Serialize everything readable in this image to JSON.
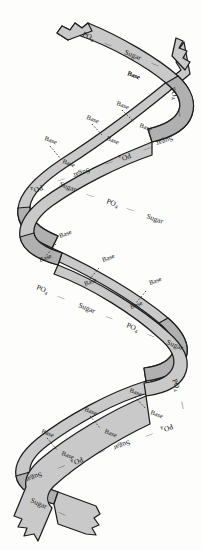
{
  "figure": {
    "name": "dna-double-helix",
    "background_color": "#fdfdfc",
    "ribbon_front_color": "#c9c9c9",
    "ribbon_back_color": "#b0b0b0",
    "outline_color": "#1c1c1c",
    "text_color": "#1a1a1a"
  },
  "labels": {
    "base": "Base",
    "sugar": "Sugar",
    "phosphate": "PO",
    "phosphate_sub": "4",
    "dash": "—"
  },
  "backbone_runs": [
    {
      "id": "run-top-right-strand",
      "text_sequence": [
        "PO4",
        "Sugar"
      ],
      "glyphs": [
        {
          "text": "PO",
          "sub": "4",
          "x": 82,
          "y": 36,
          "rot": 22
        },
        {
          "text": "—",
          "x": 104,
          "y": 45,
          "rot": 22
        },
        {
          "text": "Sugar",
          "x": 124,
          "y": 54,
          "rot": 22
        },
        {
          "text": "—",
          "x": 151,
          "y": 65,
          "rot": 22
        }
      ]
    },
    {
      "id": "run-upper-right-descend",
      "glyphs": [
        {
          "text": "PO",
          "sub": "4",
          "x": 170,
          "y": 88,
          "rot": 72
        },
        {
          "text": "—",
          "x": 177,
          "y": 110,
          "rot": 80
        },
        {
          "text": "Sugar",
          "x": 172,
          "y": 136,
          "rot": 160
        },
        {
          "text": "—",
          "x": 150,
          "y": 146,
          "rot": 160
        },
        {
          "text": "PO",
          "sub": "4",
          "x": 130,
          "y": 153,
          "rot": 160
        },
        {
          "text": "—",
          "x": 112,
          "y": 160,
          "rot": 160
        },
        {
          "text": "Sugar",
          "x": 89,
          "y": 168,
          "rot": 160
        },
        {
          "text": "—",
          "x": 64,
          "y": 177,
          "rot": 160
        },
        {
          "text": "PO",
          "sub": "4",
          "x": 42,
          "y": 185,
          "rot": 160
        }
      ]
    },
    {
      "id": "run-mid-left-descend",
      "glyphs": [
        {
          "text": "PO",
          "sub": "4",
          "x": 36,
          "y": 289,
          "rot": 22
        },
        {
          "text": "—",
          "x": 57,
          "y": 298,
          "rot": 22
        },
        {
          "text": "Sugar",
          "x": 78,
          "y": 307,
          "rot": 22
        },
        {
          "text": "—",
          "x": 105,
          "y": 318,
          "rot": 22
        },
        {
          "text": "PO",
          "sub": "4",
          "x": 126,
          "y": 327,
          "rot": 22
        },
        {
          "text": "—",
          "x": 147,
          "y": 336,
          "rot": 22
        },
        {
          "text": "Sugar",
          "x": 166,
          "y": 344,
          "rot": 22
        }
      ]
    },
    {
      "id": "run-lower-right-descend",
      "glyphs": [
        {
          "text": "PO",
          "sub": "4",
          "x": 172,
          "y": 380,
          "rot": 70
        },
        {
          "text": "—",
          "x": 180,
          "y": 402,
          "rot": 78
        },
        {
          "text": "PO",
          "sub": "4",
          "x": 172,
          "y": 424,
          "rot": 158
        },
        {
          "text": "—",
          "x": 152,
          "y": 432,
          "rot": 158
        },
        {
          "text": "Sugar",
          "x": 129,
          "y": 440,
          "rot": 158
        },
        {
          "text": "—",
          "x": 104,
          "y": 449,
          "rot": 158
        },
        {
          "text": "PO",
          "sub": "4",
          "x": 82,
          "y": 457,
          "rot": 158
        },
        {
          "text": "—",
          "x": 64,
          "y": 464,
          "rot": 158
        },
        {
          "text": "Sugar",
          "x": 41,
          "y": 472,
          "rot": 158
        }
      ]
    },
    {
      "id": "run-bottom-left-tail",
      "glyphs": [
        {
          "text": "Sugar",
          "x": 30,
          "y": 502,
          "rot": 24
        },
        {
          "text": "—",
          "x": 58,
          "y": 514,
          "rot": 24
        }
      ]
    },
    {
      "id": "run-mid-upper-inner",
      "glyphs": [
        {
          "text": "Sugar",
          "x": 59,
          "y": 186,
          "rot": 20
        },
        {
          "text": "—",
          "x": 86,
          "y": 196,
          "rot": 20
        },
        {
          "text": "PO",
          "sub": "4",
          "x": 106,
          "y": 203,
          "rot": 20
        },
        {
          "text": "—",
          "x": 126,
          "y": 210,
          "rot": 20
        },
        {
          "text": "Sugar",
          "x": 146,
          "y": 218,
          "rot": 20
        }
      ]
    }
  ],
  "base_pairs": [
    {
      "id": "bp-1",
      "left": {
        "x": 116,
        "y": 105,
        "rot": 20
      },
      "right": {
        "x": 139,
        "y": 127,
        "rot": 20
      }
    },
    {
      "id": "bp-2",
      "left": {
        "x": 86,
        "y": 119,
        "rot": 20
      },
      "right": {
        "x": 106,
        "y": 140,
        "rot": 20
      }
    },
    {
      "id": "bp-3",
      "left": {
        "x": 44,
        "y": 140,
        "rot": 20
      },
      "right": {
        "x": 62,
        "y": 163,
        "rot": 20
      }
    },
    {
      "id": "bp-4",
      "left": {
        "x": 60,
        "y": 238,
        "rot": -20
      },
      "right": {
        "x": 40,
        "y": 262,
        "rot": -20
      }
    },
    {
      "id": "bp-5",
      "left": {
        "x": 103,
        "y": 262,
        "rot": -20
      },
      "right": {
        "x": 85,
        "y": 286,
        "rot": -20
      }
    },
    {
      "id": "bp-6",
      "left": {
        "x": 150,
        "y": 285,
        "rot": -20
      },
      "right": {
        "x": 131,
        "y": 309,
        "rot": -20
      }
    },
    {
      "id": "bp-7",
      "left": {
        "x": 129,
        "y": 392,
        "rot": 20
      },
      "right": {
        "x": 150,
        "y": 414,
        "rot": 20
      }
    },
    {
      "id": "bp-8",
      "left": {
        "x": 84,
        "y": 411,
        "rot": 20
      },
      "right": {
        "x": 104,
        "y": 433,
        "rot": 20
      }
    },
    {
      "id": "bp-9",
      "left": {
        "x": 41,
        "y": 433,
        "rot": 20
      },
      "right": {
        "x": 61,
        "y": 455,
        "rot": 20
      }
    },
    {
      "id": "bp-10",
      "left": {
        "x": 127,
        "y": 75,
        "rot": 20
      },
      "right": {
        "x": 127,
        "y": 75,
        "rot": 20
      }
    }
  ],
  "strand_ends": [
    {
      "id": "end-top-left",
      "type": "torn-edge",
      "x": 58,
      "y": 28
    },
    {
      "id": "end-top-right",
      "type": "torn-edge",
      "x": 176,
      "y": 44
    },
    {
      "id": "end-bottom-left",
      "type": "torn-edge",
      "x": 26,
      "y": 520
    },
    {
      "id": "end-bottom-right",
      "type": "torn-edge",
      "x": 92,
      "y": 528
    }
  ]
}
